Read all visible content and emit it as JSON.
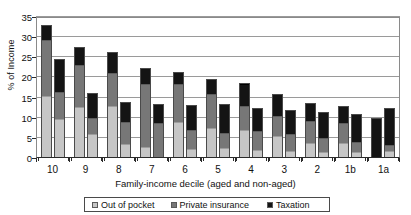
{
  "chart_data": {
    "type": "bar",
    "subtype": "stacked-grouped-vertical",
    "title": "",
    "xlabel": "Family-income decile (aged and non-aged)",
    "ylabel": "% of Income",
    "ylim": [
      0,
      35
    ],
    "ytick_step": 5,
    "yticks": [
      0,
      5,
      10,
      15,
      20,
      25,
      30,
      35
    ],
    "grid": true,
    "grid_axis": "y",
    "legend_position": "bottom",
    "categories": [
      "10",
      "9",
      "8",
      "7",
      "6",
      "5",
      "4",
      "3",
      "2",
      "1b",
      "1a"
    ],
    "group_members": [
      "aged",
      "non-aged"
    ],
    "stack_order": [
      "Out of pocket",
      "Private insurance",
      "Taxation"
    ],
    "series": [
      {
        "name": "Out of pocket",
        "color": "#c6c6c6",
        "values_aged": [
          15.4,
          12.7,
          12.9,
          2.7,
          9.0,
          7.4,
          7.0,
          5.4,
          3.8,
          3.7,
          0.0
        ],
        "values_nonaged": [
          9.8,
          5.9,
          3.4,
          0.0,
          2.3,
          2.5,
          1.9,
          1.8,
          1.6,
          1.4,
          1.7
        ]
      },
      {
        "name": "Private insurance",
        "color": "#777777",
        "values_aged": [
          13.8,
          10.3,
          8.1,
          15.6,
          9.3,
          8.4,
          5.9,
          5.1,
          5.5,
          5.0,
          0.0
        ],
        "values_nonaged": [
          6.6,
          4.1,
          5.5,
          8.7,
          4.6,
          3.8,
          4.8,
          4.2,
          3.3,
          2.7,
          1.6
        ]
      },
      {
        "name": "Taxation",
        "color": "#141414",
        "values_aged": [
          3.8,
          4.6,
          5.4,
          4.1,
          3.1,
          3.8,
          5.6,
          5.3,
          4.3,
          4.1,
          10.0
        ],
        "values_nonaged": [
          8.1,
          6.2,
          4.9,
          4.8,
          6.3,
          7.0,
          5.7,
          6.0,
          6.6,
          6.9,
          9.0
        ]
      }
    ],
    "totals_aged": [
      33.0,
      27.6,
      26.4,
      22.4,
      21.4,
      19.6,
      18.5,
      15.8,
      13.6,
      12.8,
      10.0
    ],
    "totals_nonaged": [
      24.5,
      16.2,
      13.8,
      13.5,
      13.2,
      13.3,
      12.4,
      12.0,
      11.5,
      11.0,
      10.6
    ]
  },
  "axis": {
    "y_title": "% of Income",
    "x_title": "Family-income decile (aged and non-aged)",
    "y_tick_labels": [
      "35",
      "30",
      "25",
      "20",
      "15",
      "10",
      "5",
      "0"
    ],
    "x_tick_labels": [
      "10",
      "9",
      "8",
      "7",
      "6",
      "5",
      "4",
      "3",
      "2",
      "1b",
      "1a"
    ]
  },
  "legend": {
    "items": [
      {
        "label": "Out of pocket",
        "swatch": "out-of-pocket-swatch",
        "color": "#c6c6c6"
      },
      {
        "label": "Private insurance",
        "swatch": "private-insurance-swatch",
        "color": "#777777"
      },
      {
        "label": "Taxation",
        "swatch": "taxation-swatch",
        "color": "#141414"
      }
    ]
  },
  "colors": {
    "out_of_pocket": "#c6c6c6",
    "private_insurance": "#777777",
    "taxation": "#141414",
    "gridline": "#9a9a9a",
    "axis": "#2a2a2a",
    "background": "#ffffff"
  }
}
